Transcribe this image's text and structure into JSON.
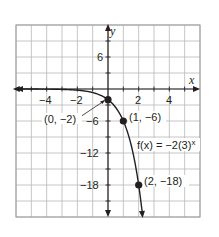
{
  "chart_data": {
    "type": "line",
    "title": "",
    "xlabel": "x",
    "ylabel": "y",
    "xlim": [
      -6,
      6
    ],
    "ylim": [
      -24,
      12
    ],
    "x_grid_step": 1,
    "y_grid_step": 3,
    "grid": true,
    "x_ticks": [
      {
        "value": -4,
        "label": "−4"
      },
      {
        "value": -2,
        "label": "−2"
      },
      {
        "value": 2,
        "label": "2"
      },
      {
        "value": 4,
        "label": "4"
      }
    ],
    "y_ticks": [
      {
        "value": 6,
        "label": "6"
      },
      {
        "value": -6,
        "label": "−6"
      },
      {
        "value": -12,
        "label": "−12"
      },
      {
        "value": -18,
        "label": "−18"
      }
    ],
    "series": [
      {
        "name": "f(x) = −2(3)^x",
        "function": "-2*3^x",
        "x_range": [
          -6,
          2.26
        ],
        "color": "#231f20"
      }
    ],
    "points": [
      {
        "x": 0,
        "y": -2,
        "label": "(0, −2)"
      },
      {
        "x": 1,
        "y": -6,
        "label": "(1, −6)"
      },
      {
        "x": 2,
        "y": -18,
        "label": "(2, −18)"
      }
    ],
    "annotations": [
      {
        "text_prefix": "f(x) = −2(3)",
        "text_exp": "x",
        "x": 0.7,
        "y": -10
      }
    ],
    "colors": {
      "grid": "#b8b8b8",
      "grid_border": "#9a9a9a",
      "axis": "#231f20",
      "curve": "#231f20",
      "background": "#ffffff"
    }
  },
  "labels": {
    "x_axis": "x",
    "y_axis": "y",
    "fn_prefix": "f(x) = −2(3)",
    "fn_exp": "x",
    "p0": "(0, −2)",
    "p1": "(1, −6)",
    "p2": "(2, −18)",
    "xt_m4": "−4",
    "xt_m2": "−2",
    "xt_2": "2",
    "xt_4": "4",
    "yt_6": "6",
    "yt_m6": "−6",
    "yt_m12": "−12",
    "yt_m18": "−18"
  }
}
